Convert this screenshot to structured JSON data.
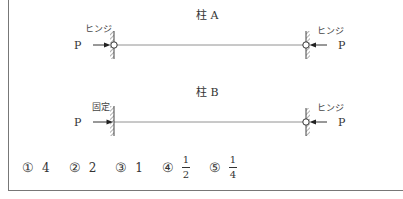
{
  "figure": {
    "column_a": {
      "title": "柱 A",
      "left_support": "ヒンジ",
      "right_support": "ヒンジ",
      "load_left": "P",
      "load_right": "P"
    },
    "column_b": {
      "title": "柱 B",
      "left_support": "固定",
      "right_support": "ヒンジ",
      "load_left": "P",
      "load_right": "P"
    }
  },
  "choices": [
    {
      "marker": "①",
      "value": "4"
    },
    {
      "marker": "②",
      "value": "2"
    },
    {
      "marker": "③",
      "value": "1"
    },
    {
      "marker": "④",
      "numerator": "1",
      "denominator": "2"
    },
    {
      "marker": "⑤",
      "numerator": "1",
      "denominator": "4"
    }
  ],
  "colors": {
    "line": "#555555",
    "text": "#333333"
  }
}
